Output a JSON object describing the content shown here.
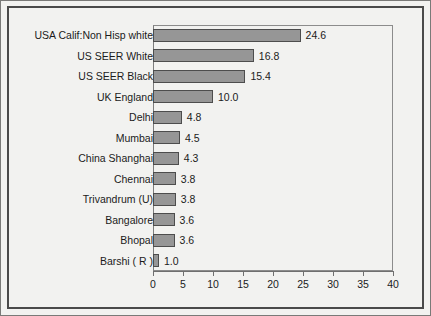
{
  "chart_data": {
    "type": "bar",
    "orientation": "horizontal",
    "title": "",
    "subtitle": "",
    "xlabel": "",
    "ylabel": "",
    "categories": [
      "USA Calif:Non Hisp white",
      "US SEER White",
      "US SEER Black",
      "UK England",
      "Delhi",
      "Mumbai",
      "China Shanghai",
      "Chennai",
      "Trivandrum (U)",
      "Bangalore",
      "Bhopal",
      "Barshi ( R )"
    ],
    "values": [
      24.6,
      16.8,
      15.4,
      10.0,
      4.8,
      4.5,
      4.3,
      3.8,
      3.8,
      3.6,
      3.6,
      1.0
    ],
    "data_labels": [
      "24.6",
      "16.8",
      "15.4",
      "10.0",
      "4.8",
      "4.5",
      "4.3",
      "3.8",
      "3.8",
      "3.6",
      "3.6",
      "1.0"
    ],
    "xlim": [
      0,
      40
    ],
    "xticks": [
      0,
      5,
      10,
      15,
      20,
      25,
      30,
      35,
      40
    ],
    "xtick_labels": [
      "0",
      "5",
      "10",
      "15",
      "20",
      "25",
      "30",
      "35",
      "40"
    ],
    "grid": false,
    "legend": null,
    "bar_color": "#969696",
    "bar_border_color": "#4d4d4d",
    "background_color": "#f2f2f0",
    "frame_color": "#4a4a4a"
  }
}
